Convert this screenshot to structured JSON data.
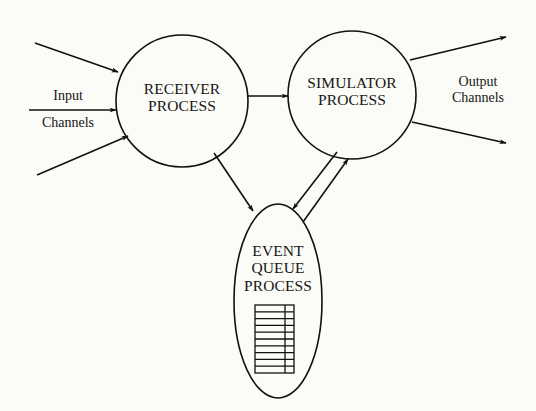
{
  "diagram": {
    "type": "process-flow",
    "colors": {
      "background": "#fbfbf8",
      "stroke": "#111111",
      "text": "#151515"
    },
    "nodes": {
      "receiver": {
        "shape": "circle",
        "line1": "RECEIVER",
        "line2": "PROCESS"
      },
      "simulator": {
        "shape": "circle",
        "line1": "SIMULATOR",
        "line2": "PROCESS"
      },
      "event_queue": {
        "shape": "ellipse",
        "line1": "EVENT",
        "line2": "QUEUE",
        "line3": "PROCESS",
        "queue_rows": 10
      }
    },
    "labels": {
      "input": {
        "line1": "Input",
        "line2": "Channels"
      },
      "output": {
        "line1": "Output",
        "line2": "Channels"
      }
    },
    "edges": [
      {
        "from": "input-channel-1",
        "to": "receiver"
      },
      {
        "from": "input-channel-2",
        "to": "receiver"
      },
      {
        "from": "input-channel-3",
        "to": "receiver"
      },
      {
        "from": "receiver",
        "to": "simulator"
      },
      {
        "from": "receiver",
        "to": "event_queue"
      },
      {
        "from": "simulator",
        "to": "event_queue"
      },
      {
        "from": "event_queue",
        "to": "simulator"
      },
      {
        "from": "simulator",
        "to": "output-channel-1"
      },
      {
        "from": "simulator",
        "to": "output-channel-2"
      }
    ]
  }
}
